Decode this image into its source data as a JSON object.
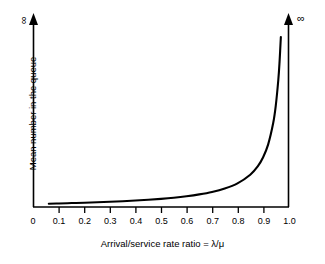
{
  "chart_data": {
    "type": "line",
    "title": "",
    "xlabel": "Arrival/service rate ratio = λ/μ",
    "ylabel": "Mean number in the queue",
    "x_tick_labels": [
      "0",
      "0.1",
      "0.2",
      "0.3",
      "0.4",
      "0.5",
      "0.6",
      "0.7",
      "0.8",
      "0.9",
      "1.0"
    ],
    "x_tick_values": [
      0,
      0.1,
      0.2,
      0.3,
      0.4,
      0.5,
      0.6,
      0.7,
      0.8,
      0.9,
      1.0
    ],
    "y_tick_labels": [],
    "xlim": [
      0,
      1.0
    ],
    "ylim": [
      0,
      1.0
    ],
    "grid": false,
    "legend": null,
    "y_axis_top_annotation": "∞",
    "x_axis_top_annotation": "∞",
    "series": [
      {
        "name": "Mean queue length rho/(1-rho)",
        "x": [
          0.06,
          0.1,
          0.15,
          0.2,
          0.25,
          0.3,
          0.35,
          0.4,
          0.45,
          0.5,
          0.55,
          0.6,
          0.65,
          0.7,
          0.75,
          0.8,
          0.85,
          0.88,
          0.9,
          0.92,
          0.94,
          0.95,
          0.96,
          0.965,
          0.97
        ],
        "y": [
          0.006,
          0.011,
          0.018,
          0.025,
          0.033,
          0.043,
          0.054,
          0.067,
          0.082,
          0.1,
          0.122,
          0.15,
          0.186,
          0.233,
          0.3,
          0.4,
          0.567,
          0.733,
          0.9,
          1.15,
          1.567,
          1.9,
          2.4,
          2.757,
          3.233
        ]
      }
    ],
    "annotation": "Queue length grows without bound as the arrival/service rate ratio approaches 1.0"
  },
  "axis": {
    "origin_label": "0",
    "x_end_label": "1.0"
  }
}
